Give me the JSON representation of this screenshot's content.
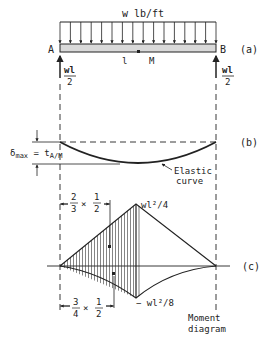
{
  "load": {
    "label": "w lb/ft",
    "arrow_count": 16
  },
  "beam": {
    "left_label": "A",
    "right_label": "B",
    "length_label": "l",
    "mid_label": "M",
    "part_label": "(a)"
  },
  "reactions": {
    "left": {
      "num": "wl",
      "den": "2"
    },
    "right": {
      "num": "wl",
      "den": "2"
    }
  },
  "deflection": {
    "delta_label": "δmax = tA/M",
    "delta_main": "δ",
    "delta_sub": "max",
    "equals": " = t",
    "t_sub": "A/M",
    "curve_label_1": "Elastic",
    "curve_label_2": "curve",
    "part_label": "(b)"
  },
  "moment": {
    "top_label": "wl²/4",
    "bottom_label": "− wl²/8",
    "dim_top": {
      "a_num": "2",
      "a_den": "3",
      "times": "×",
      "b_num": "1",
      "b_den": "2"
    },
    "dim_bottom": {
      "a_num": "3",
      "a_den": "4",
      "times": "×",
      "b_num": "1",
      "b_den": "2"
    },
    "caption_1": "Moment",
    "caption_2": "diagram",
    "part_label": "(c)"
  },
  "colors": {
    "ink": "#222222",
    "beam_fill": "#d9d9d9",
    "background": "#ffffff"
  }
}
